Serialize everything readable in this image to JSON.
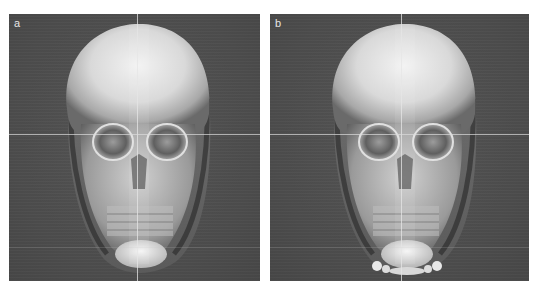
{
  "figure": {
    "panels": [
      {
        "label": "a",
        "description": "3D CT volume rendering of skull, frontal view, with crosshair"
      },
      {
        "label": "b",
        "description": "3D CT volume rendering of skull, frontal view, with crosshair; chin region shows additional bony fragments"
      }
    ],
    "colors": {
      "background": "#4f4f4f",
      "crosshair": "#e6e6e6",
      "separator": "#ffffff"
    }
  }
}
